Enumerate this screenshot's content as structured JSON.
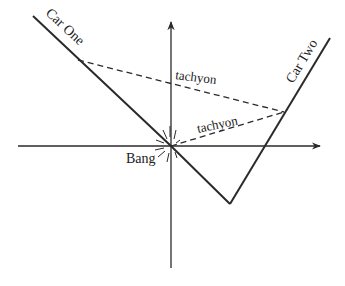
{
  "diagram": {
    "type": "spacetime-diagram",
    "colors": {
      "ink": "#2a2a2a",
      "background": "#ffffff"
    },
    "axes": {
      "horizontal": {
        "x1": 18,
        "y1": 146,
        "x2": 320,
        "y2": 146,
        "arrow": "right"
      },
      "vertical": {
        "x1": 171,
        "y1": 268,
        "x2": 171,
        "y2": 22,
        "arrow": "up"
      }
    },
    "worldlines": [
      {
        "name": "Car One",
        "label": "Car One",
        "points": [
          [
            33,
            16
          ],
          [
            171,
            146
          ],
          [
            230,
            204
          ]
        ]
      },
      {
        "name": "Car Two",
        "label": "Car Two",
        "points": [
          [
            230,
            204
          ],
          [
            330,
            38
          ]
        ]
      }
    ],
    "tachyons": [
      {
        "label": "tachyon",
        "from": [
          78,
          60
        ],
        "to": [
          284,
          112
        ]
      },
      {
        "label": "tachyon",
        "from": [
          171,
          146
        ],
        "to": [
          284,
          112
        ]
      }
    ],
    "event": {
      "label": "Bang",
      "at": [
        171,
        146
      ]
    }
  },
  "labels": {
    "car_one": "Car One",
    "car_two": "Car Two",
    "tachyon_upper": "tachyon",
    "tachyon_lower": "tachyon",
    "bang": "Bang"
  }
}
